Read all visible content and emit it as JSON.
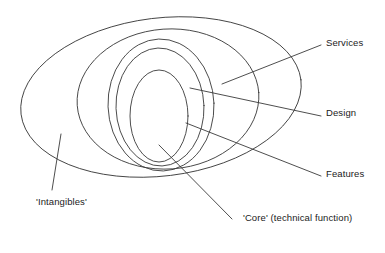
{
  "figure": {
    "background_color": "#ffffff",
    "stroke_color": "#3a3a3a",
    "text_color": "#1b1b1b"
  },
  "labels": {
    "services": "Services",
    "design": "Design",
    "features": "Features",
    "core": "'Core' (technical function)",
    "intangibles": "'Intangibles'"
  },
  "chart_data": {
    "type": "diagram",
    "subtype": "concentric-ellipses",
    "title": "",
    "rings": [
      {
        "name": "'Intangibles'",
        "level": 1,
        "cx": 161,
        "cy": 97,
        "rx": 141,
        "ry": 79,
        "rotation": -7
      },
      {
        "name": "Services",
        "level": 2,
        "cx": 168,
        "cy": 99,
        "rx": 91,
        "ry": 70,
        "rotation": -4
      },
      {
        "name": "Design",
        "level": 3,
        "cx": 161,
        "cy": 105,
        "rx": 53,
        "ry": 66,
        "rotation": -2
      },
      {
        "name": "Features",
        "level": 4,
        "cx": 160,
        "cy": 107,
        "rx": 44,
        "ry": 59,
        "rotation": -2
      },
      {
        "name": "'Core' (technical function)",
        "level": 5,
        "cx": 159,
        "cy": 116,
        "rx": 29,
        "ry": 46,
        "rotation": 0
      }
    ],
    "leaders": [
      {
        "label": "Services",
        "x1": 222,
        "y1": 84,
        "x2": 321,
        "y2": 45
      },
      {
        "label": "Design",
        "x1": 190,
        "y1": 88,
        "x2": 321,
        "y2": 116
      },
      {
        "label": "Features",
        "x1": 186,
        "y1": 123,
        "x2": 321,
        "y2": 176
      },
      {
        "label": "'Core' (technical function)",
        "x1": 159,
        "y1": 145,
        "x2": 232,
        "y2": 219
      },
      {
        "label": "'Intangibles'",
        "x1": 61,
        "y1": 134,
        "x2": 52,
        "y2": 190
      }
    ]
  }
}
